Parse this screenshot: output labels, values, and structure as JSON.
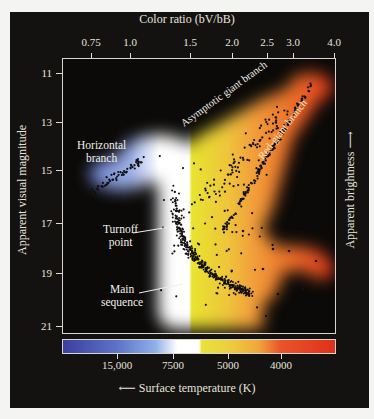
{
  "chart_data": {
    "type": "scatter",
    "top_axis": {
      "label": "Color ratio (bV/bB)",
      "ticks": [
        {
          "label": "0.75",
          "x": 91
        },
        {
          "label": "1.0",
          "x": 130
        },
        {
          "label": "1.5",
          "x": 190
        },
        {
          "label": "2.0",
          "x": 232
        },
        {
          "label": "2.5",
          "x": 267
        },
        {
          "label": "3.0",
          "x": 293
        },
        {
          "label": "4.0",
          "x": 334
        }
      ]
    },
    "bottom_axis": {
      "label": "Surface temperature (K)",
      "arrow": "←",
      "ticks": [
        {
          "label": "15,000",
          "x": 117
        },
        {
          "label": "7500",
          "x": 173
        },
        {
          "label": "5000",
          "x": 228
        },
        {
          "label": "4000",
          "x": 281
        }
      ]
    },
    "left_axis": {
      "label": "Apparent visual magnitude",
      "ticks": [
        {
          "label": "11",
          "y": 73
        },
        {
          "label": "13",
          "y": 122
        },
        {
          "label": "15",
          "y": 170
        },
        {
          "label": "17",
          "y": 223
        },
        {
          "label": "19",
          "y": 273
        },
        {
          "label": "21",
          "y": 326
        }
      ],
      "ylim": [
        22,
        10.5
      ],
      "inverted": true
    },
    "right_axis": {
      "label": "Apparent brightness",
      "arrow": "→ up"
    },
    "annotations": [
      {
        "text": "Horizontal branch",
        "region": "blue, upper-left, mag ~15, color ratio ~0.8–1.2"
      },
      {
        "text": "Asymptotic giant branch",
        "region": "rotated, yellow, color ratio ~1.6–2.2, mag 13–15"
      },
      {
        "text": "Red-giant branch",
        "region": "rotated, orange-red, color ratio ~2.2–3.5, mag 11.5–15"
      },
      {
        "text": "Turnoff point",
        "region": "mag ~18.2, color ratio ~1.5"
      },
      {
        "text": "Main sequence",
        "region": "mag ~19.5–21, color ratio ~1.5–2.0"
      }
    ],
    "color_bar": {
      "stops": [
        "#3b3f9e",
        "#6a8fd4",
        "#ffffff",
        "#ffffff",
        "#e8e33a",
        "#f0a93a",
        "#e8531e",
        "#e0301a"
      ]
    },
    "series": [
      {
        "name": "Horizontal branch stars",
        "approx_points": [
          [
            0.8,
            15.2
          ],
          [
            0.9,
            15.0
          ],
          [
            1.0,
            14.8
          ],
          [
            1.1,
            14.6
          ],
          [
            1.2,
            14.5
          ],
          [
            1.3,
            14.4
          ]
        ]
      },
      {
        "name": "Red-giant branch stars",
        "approx_points": [
          [
            1.9,
            15.5
          ],
          [
            2.0,
            14.8
          ],
          [
            2.1,
            14.0
          ],
          [
            2.3,
            13.2
          ],
          [
            2.6,
            12.5
          ],
          [
            3.2,
            11.7
          ]
        ]
      },
      {
        "name": "Main sequence / turnoff stars",
        "approx_points": [
          [
            1.5,
            18.0
          ],
          [
            1.55,
            18.8
          ],
          [
            1.6,
            19.5
          ],
          [
            1.7,
            20.2
          ],
          [
            1.85,
            20.8
          ],
          [
            2.0,
            21.0
          ]
        ]
      },
      {
        "name": "Red clump (lower right)",
        "approx_points": [
          [
            2.8,
            18.3
          ],
          [
            3.0,
            18.4
          ],
          [
            3.6,
            18.8
          ]
        ]
      }
    ]
  },
  "labels": {
    "top_title": "Color ratio (bV/bB)",
    "left_title": "Apparent visual magnitude",
    "right_title": "Apparent brightness ⟶",
    "bottom_title": "⟵ Surface temperature (K)",
    "ann_horizontal": "Horizontal",
    "ann_horizontal2": "branch",
    "ann_agb": "Asymptotic giant branch",
    "ann_rgb": "Red-giant branch",
    "ann_turnoff": "Turnoff",
    "ann_turnoff2": "point",
    "ann_main": "Main",
    "ann_main2": "sequence"
  }
}
